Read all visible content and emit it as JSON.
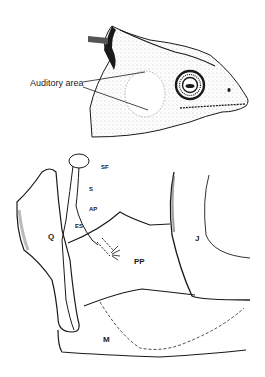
{
  "figure": {
    "top_panel": {
      "subject": "lizard head, lateral view",
      "label": "Auditory area"
    },
    "bottom_panel": {
      "subject": "middle ear skeletal anatomy",
      "labels": {
        "sf": "SF",
        "s": "S",
        "ap": "AP",
        "es": "ES",
        "q": "Q",
        "pp": "PP",
        "j": "J",
        "m": "M"
      }
    }
  },
  "colors": {
    "ink": "#1a1a1a",
    "background": "#ffffff",
    "stipple": "#8a8a8a"
  }
}
